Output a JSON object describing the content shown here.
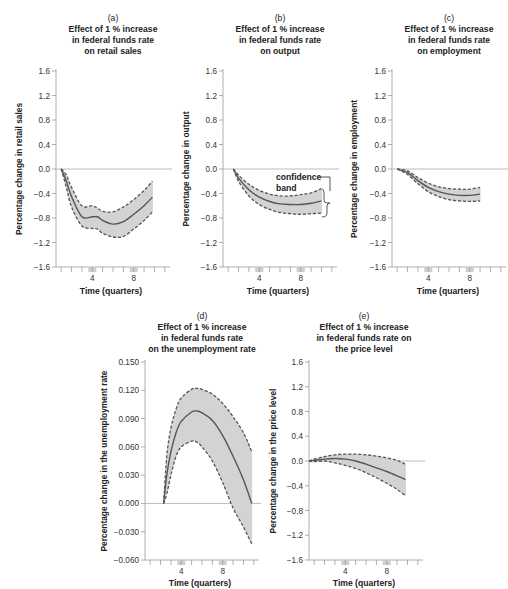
{
  "colors": {
    "band_fill": "#d3d3d3",
    "line": "#555555",
    "dash": "#555555",
    "zero_line": "#b5b5b5",
    "axis": "#9a9a9a",
    "tick_highlight": "#cfcfcf"
  },
  "chart_data": [
    {
      "id": "a",
      "type": "line",
      "panel_label": "(a)",
      "title": [
        "Effect of 1 % increase",
        "in federal funds rate",
        "on retail sales"
      ],
      "xlabel": "Time (quarters)",
      "ylabel": "Percentage change in retail sales",
      "yticks": [
        "1.6",
        "1.2",
        "0.8",
        "0.4",
        "0.0",
        "-0.4",
        "-0.8",
        "-1.2",
        "-1.6"
      ],
      "ylim": [
        -1.6,
        1.6
      ],
      "xlim": [
        0.5,
        11.5
      ],
      "xticks_labeled": [
        4,
        8
      ],
      "x": [
        1,
        1.5,
        2,
        3,
        4,
        4.5,
        5,
        6,
        7,
        8,
        9,
        9.8
      ],
      "estimate": [
        0.0,
        -0.2,
        -0.45,
        -0.78,
        -0.78,
        -0.78,
        -0.84,
        -0.9,
        -0.86,
        -0.74,
        -0.6,
        -0.46
      ],
      "upper": [
        0.0,
        -0.1,
        -0.3,
        -0.6,
        -0.6,
        -0.64,
        -0.69,
        -0.7,
        -0.62,
        -0.5,
        -0.35,
        -0.2
      ],
      "lower": [
        0.0,
        -0.3,
        -0.62,
        -0.93,
        -0.97,
        -0.98,
        -1.05,
        -1.11,
        -1.1,
        -0.98,
        -0.84,
        -0.7
      ],
      "legend": []
    },
    {
      "id": "b",
      "type": "line",
      "panel_label": "(b)",
      "title": [
        "Effect of 1 % increase",
        "in federal funds rate",
        "on output"
      ],
      "xlabel": "Time (quarters)",
      "ylabel": "Percentage change in output",
      "yticks": [
        "1.6",
        "1.2",
        "0.8",
        "0.4",
        "0.0",
        "-0.4",
        "-0.8",
        "-1.2",
        "-1.6"
      ],
      "ylim": [
        -1.6,
        1.6
      ],
      "xlim": [
        0.5,
        11.5
      ],
      "xticks_labeled": [
        4,
        8
      ],
      "x": [
        1.5,
        2,
        3,
        4,
        5,
        6,
        7,
        8,
        9,
        10
      ],
      "estimate": [
        0.0,
        -0.15,
        -0.34,
        -0.46,
        -0.53,
        -0.57,
        -0.58,
        -0.58,
        -0.56,
        -0.52
      ],
      "upper": [
        0.0,
        -0.1,
        -0.25,
        -0.35,
        -0.41,
        -0.44,
        -0.44,
        -0.42,
        -0.39,
        -0.32
      ],
      "lower": [
        0.0,
        -0.2,
        -0.44,
        -0.58,
        -0.66,
        -0.71,
        -0.73,
        -0.74,
        -0.73,
        -0.72
      ],
      "annotation": {
        "text": [
          "confidence",
          "band"
        ],
        "at_x": 10,
        "y_range": [
          -0.32,
          -0.72
        ]
      },
      "legend": []
    },
    {
      "id": "c",
      "type": "line",
      "panel_label": "(c)",
      "title": [
        "Effect of 1 % increase",
        "in federal funds rate",
        "on employment"
      ],
      "xlabel": "Time (quarters)",
      "ylabel": "Percentage change in employment",
      "yticks": [
        "1.6",
        "1.2",
        "0.8",
        "0.4",
        "0.0",
        "-0.4",
        "-0.8",
        "-1.2",
        "-1.6"
      ],
      "ylim": [
        -1.6,
        1.6
      ],
      "xlim": [
        0.5,
        11.5
      ],
      "xticks_labeled": [
        4,
        8
      ],
      "x": [
        1,
        2,
        3,
        4,
        5,
        6,
        7,
        8,
        9
      ],
      "estimate": [
        0.0,
        -0.06,
        -0.19,
        -0.3,
        -0.37,
        -0.41,
        -0.43,
        -0.43,
        -0.41
      ],
      "upper": [
        0.0,
        -0.03,
        -0.14,
        -0.23,
        -0.29,
        -0.32,
        -0.33,
        -0.33,
        -0.3
      ],
      "lower": [
        0.0,
        -0.09,
        -0.24,
        -0.37,
        -0.45,
        -0.5,
        -0.52,
        -0.53,
        -0.52
      ],
      "legend": []
    },
    {
      "id": "d",
      "type": "line",
      "panel_label": "(d)",
      "title": [
        "Effect of 1 % increase",
        "in federal funds rate",
        "on the unemployment rate"
      ],
      "xlabel": "Time (quarters)",
      "ylabel": "Percentage change in the unemployment rate",
      "yticks": [
        "0.150",
        "0.120",
        "0.090",
        "0.060",
        "0.030",
        "0.000",
        "-0.030",
        "-0.060"
      ],
      "ylim": [
        -0.06,
        0.15
      ],
      "xlim": [
        0.5,
        11.5
      ],
      "xticks_labeled": [
        4,
        8
      ],
      "x": [
        2.3,
        2.6,
        3,
        3.5,
        4,
        5,
        5.5,
        6,
        7,
        8,
        9,
        10,
        10.8
      ],
      "estimate": [
        0.0,
        0.03,
        0.055,
        0.075,
        0.087,
        0.097,
        0.098,
        0.096,
        0.088,
        0.072,
        0.05,
        0.025,
        0.0
      ],
      "upper": [
        0.0,
        0.05,
        0.08,
        0.1,
        0.112,
        0.121,
        0.122,
        0.121,
        0.116,
        0.106,
        0.092,
        0.075,
        0.055
      ],
      "lower": [
        0.0,
        0.01,
        0.03,
        0.05,
        0.06,
        0.066,
        0.065,
        0.06,
        0.045,
        0.022,
        -0.005,
        -0.025,
        -0.043
      ],
      "legend": []
    },
    {
      "id": "e",
      "type": "line",
      "panel_label": "(e)",
      "title": [
        "Effect of 1 % increase",
        "in federal funds rate on",
        "the price level"
      ],
      "xlabel": "Time (quarters)",
      "ylabel": "Percentage change in the price level",
      "yticks": [
        "1.6",
        "1.2",
        "0.8",
        "0.4",
        "0.0",
        "-0.4",
        "-0.8",
        "-1.2",
        "-1.6"
      ],
      "ylim": [
        -1.6,
        1.6
      ],
      "xlim": [
        0.5,
        11.5
      ],
      "xticks_labeled": [
        4,
        8
      ],
      "x": [
        0.5,
        1,
        2,
        3,
        4,
        5,
        6,
        7,
        8,
        9,
        9.8
      ],
      "estimate": [
        0.0,
        0.01,
        0.03,
        0.04,
        0.03,
        0.0,
        -0.05,
        -0.11,
        -0.17,
        -0.24,
        -0.3
      ],
      "upper": [
        0.0,
        0.03,
        0.07,
        0.1,
        0.11,
        0.11,
        0.1,
        0.08,
        0.05,
        0.01,
        -0.05
      ],
      "lower": [
        0.0,
        -0.01,
        0.0,
        -0.03,
        -0.07,
        -0.12,
        -0.19,
        -0.27,
        -0.36,
        -0.46,
        -0.56
      ],
      "legend": []
    }
  ]
}
